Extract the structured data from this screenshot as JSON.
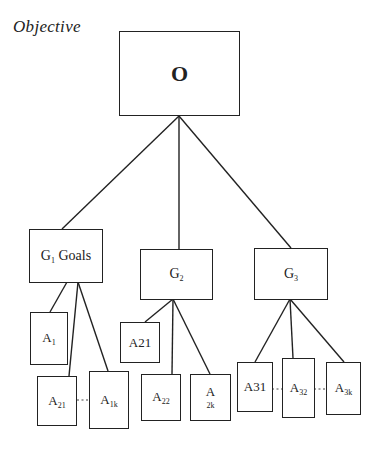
{
  "title": "Objective",
  "objective": {
    "label": "O"
  },
  "goals": [
    {
      "id": "G1",
      "main": "G",
      "sub": "1",
      "suffix": " Goals"
    },
    {
      "id": "G2",
      "main": "G",
      "sub": "2",
      "suffix": ""
    },
    {
      "id": "G3",
      "main": "G",
      "sub": "3",
      "suffix": ""
    }
  ],
  "actions": {
    "g1": [
      {
        "main": "A",
        "sub": "1"
      },
      {
        "main": "A",
        "sub": "21"
      },
      {
        "main": "A",
        "sub": "1k"
      }
    ],
    "g2": [
      {
        "main": "A21",
        "sub": ""
      },
      {
        "main": "A",
        "sub": "22"
      },
      {
        "main": "A",
        "sub": "2k"
      }
    ],
    "g3": [
      {
        "main": "A31",
        "sub": ""
      },
      {
        "main": "A",
        "sub": "32"
      },
      {
        "main": "A",
        "sub": "3k"
      }
    ]
  },
  "colors": {
    "line": "#222222",
    "background": "#ffffff"
  }
}
